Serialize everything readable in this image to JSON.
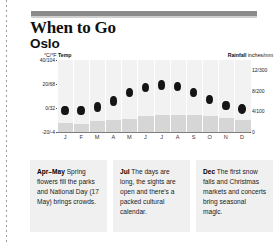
{
  "header": {
    "title": "When to Go",
    "subtitle": "Oslo"
  },
  "chart_data": {
    "type": "bar",
    "subtitle": "Oslo",
    "categories": [
      "J",
      "F",
      "M",
      "A",
      "M",
      "J",
      "J",
      "A",
      "S",
      "O",
      "N",
      "D"
    ],
    "months_full": [
      "January",
      "February",
      "March",
      "April",
      "May",
      "June",
      "July",
      "August",
      "September",
      "October",
      "November",
      "December"
    ],
    "xlabel": "",
    "grid": false,
    "legend": "none",
    "series": [
      {
        "name": "Temp",
        "type": "scatter",
        "axis": "left",
        "unit": "°C/°F",
        "axis_label": "°C/°F Temp",
        "ylim": [
          -20,
          40
        ],
        "ticks": [
          {
            "value": 40,
            "label": "40/104"
          },
          {
            "value": 20,
            "label": "20/68"
          },
          {
            "value": 0,
            "label": "0/32"
          },
          {
            "value": -20,
            "label": "-20/-4"
          }
        ],
        "values": [
          -2,
          -2,
          1,
          6,
          13,
          17,
          19,
          18,
          13,
          7,
          2,
          -1
        ]
      },
      {
        "name": "Rainfall",
        "type": "bar",
        "axis": "right",
        "unit": "inches/mm",
        "axis_label": "Rainfall inches/mm",
        "ylim": [
          0,
          14
        ],
        "ticks": [
          {
            "value": 12,
            "label": "12/300"
          },
          {
            "value": 8,
            "label": "8/200"
          },
          {
            "value": 4,
            "label": "4/100"
          },
          {
            "value": 0,
            "label": "0"
          }
        ],
        "values": [
          1.8,
          1.5,
          2.1,
          2.4,
          2.6,
          3.1,
          3.4,
          3.4,
          3.4,
          3.2,
          2.8,
          2.3
        ]
      }
    ]
  },
  "tips": [
    {
      "id": "tip-apr-may",
      "month": "Apr–May",
      "text": " Spring flowers fill the parks and National Day (17 May) brings crowds."
    },
    {
      "id": "tip-jul",
      "month": "Jul",
      "text": " The days are long, the sights are open and there's a packed cultural calendar."
    },
    {
      "id": "tip-dec",
      "month": "Dec",
      "text": " The first snow falls and Christmas markets and concerts bring seasonal magic."
    }
  ]
}
